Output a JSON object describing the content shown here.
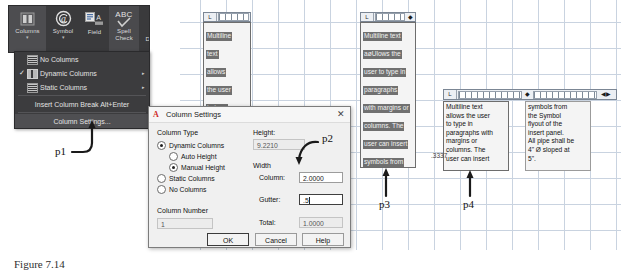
{
  "ribbon": {
    "buttons": [
      {
        "label": "Columns",
        "icon": "columns-icon",
        "caret": "▾",
        "selected": true
      },
      {
        "label": "Symbol",
        "icon": "at-symbol-icon",
        "caret": "▾",
        "selected": false
      },
      {
        "label": "Field",
        "icon": "field-icon",
        "caret": "",
        "selected": false
      },
      {
        "label": "Spell\nCheck",
        "icon": "abc-check-icon",
        "caret": "",
        "selected": false
      },
      {
        "label": "Dic",
        "icon": "dictionary-icon",
        "caret": "",
        "selected": false
      }
    ],
    "spell_line1": "Spell",
    "spell_line2": "Check",
    "dict_label": "Dic",
    "abc_text": "ABC"
  },
  "dropdown": {
    "items": [
      {
        "label": "No Columns",
        "checked": false,
        "submenu": false
      },
      {
        "label": "Dynamic Columns",
        "checked": true,
        "submenu": true
      },
      {
        "label": "Static Columns",
        "checked": false,
        "submenu": true
      }
    ],
    "insert_break": "Insert Column Break Alt+Enter",
    "column_settings": "Column Settings...",
    "check_glyph": "✓",
    "submenu_glyph": "▸"
  },
  "dialog": {
    "title": "Column Settings",
    "app_icon_letter": "A",
    "close_glyph": "✕",
    "column_type_label": "Column Type",
    "radios": [
      {
        "label": "Dynamic Columns",
        "selected": true,
        "indent": 0
      },
      {
        "label": "Auto Height",
        "selected": false,
        "indent": 1
      },
      {
        "label": "Manual Height",
        "selected": true,
        "indent": 1
      },
      {
        "label": "Static Columns",
        "selected": false,
        "indent": 0
      },
      {
        "label": "No Columns",
        "selected": false,
        "indent": 0
      }
    ],
    "column_number_label": "Column Number",
    "column_number_value": "1",
    "height_label": "Height:",
    "height_value": "9.2210",
    "width_label": "Width",
    "column_label": "Column:",
    "column_value": "2.0000",
    "gutter_label": "Gutter:",
    "gutter_value": ".5",
    "total_label": "Total:",
    "total_value": "1.0000",
    "ok_label": "OK",
    "cancel_label": "Cancel",
    "help_label": "Help"
  },
  "editor_panels": [
    {
      "name": "panel-p1",
      "ruler_corner": "L",
      "lines": [
        "Multiline",
        "text",
        "allows",
        "the user",
        "to type",
        "in",
        "paragraphs"
      ]
    },
    {
      "name": "panel-p3",
      "ruler_corner": "L",
      "lines": [
        "Multiline text",
        "aøUlows the",
        "user to type in",
        "paragraphs",
        "with margins or",
        "columns.  The",
        "user can insert",
        "symbols from",
        "the Symbol",
        "flyout of the",
        "insert panel.",
        "All pipe shall be",
        "4\" Ø sloped at",
        "5\"."
      ]
    },
    {
      "name": "panel-p4-left",
      "ruler_corner": "L",
      "lines": [
        "Multiline text",
        "allows the user",
        "to type in",
        "paragraphs with",
        "margins or",
        "columns.  The",
        "user can insert"
      ]
    },
    {
      "name": "panel-p4-right",
      "ruler_corner": "",
      "lines": [
        "symbols from",
        "the Symbol",
        "flyout of  the",
        "insert panel.",
        "All pipe shall be",
        "4\" Ø sloped at",
        "5\"."
      ]
    }
  ],
  "coordinate_readout": ".3337",
  "callouts": [
    {
      "label": "p1"
    },
    {
      "label": "p2"
    },
    {
      "label": "p3"
    },
    {
      "label": "p4"
    }
  ],
  "caption": "Figure 7.14",
  "colors": {
    "ribbon_bg": "#3a3a3c",
    "menu_bg": "#3c3c3e",
    "dialog_bg": "#f0f0f0",
    "grid_line": "#c9d3e0",
    "highlight": "#707070",
    "accent_red": "#cf2a27"
  }
}
